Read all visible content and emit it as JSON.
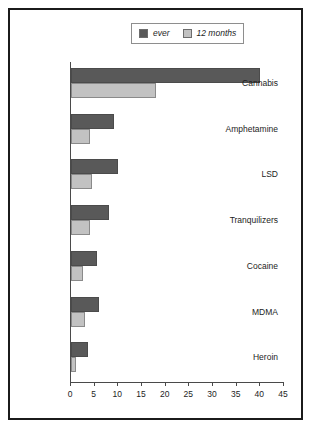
{
  "chart_data": {
    "type": "bar",
    "orientation": "horizontal",
    "title": "",
    "xlabel": "",
    "ylabel": "",
    "xlim": [
      0,
      45
    ],
    "xticks": [
      0,
      5,
      10,
      15,
      20,
      25,
      30,
      35,
      40,
      45
    ],
    "grid": false,
    "legend_position": "top-center",
    "categories": [
      "Cannabis",
      "Amphetamine",
      "LSD",
      "Tranquilizers",
      "Cocaine",
      "MDMA",
      "Heroin"
    ],
    "series": [
      {
        "name": "ever",
        "color": "#595959",
        "values": [
          40,
          9,
          10,
          8,
          5.5,
          6,
          3.5
        ]
      },
      {
        "name": "12 months",
        "color": "#c2c2c2",
        "values": [
          18,
          4,
          4.5,
          4,
          2.5,
          3,
          1
        ]
      }
    ]
  },
  "legend": {
    "entries": [
      {
        "label": "ever",
        "swatch": "ever"
      },
      {
        "label": "12 months",
        "swatch": "months12"
      }
    ]
  },
  "colors": {
    "ever": "#595959",
    "months12": "#c2c2c2",
    "frame": "#1b1b1b",
    "axis": "#4a4a4a",
    "text": "#1d1d1d"
  }
}
